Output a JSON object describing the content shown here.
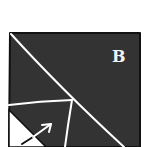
{
  "diagram": {
    "kind": "folding-illustration",
    "colors": {
      "background": "#ffffff",
      "paper": "#333333",
      "border": "#111111",
      "crease": "#ffffff",
      "flap": "#ffffff",
      "arrow_on_dark": "#ffffff",
      "arrow_on_light": "#111111",
      "label": "#f4f4f4"
    },
    "label": {
      "text": "B",
      "x": 116,
      "y": 62
    },
    "paper_square": {
      "top_left": [
        10,
        33
      ],
      "top_right": [
        140,
        33
      ],
      "bottom_left": [
        9,
        147
      ],
      "bottom_right": [
        140,
        147
      ]
    },
    "creases": [
      {
        "name": "main-diagonal",
        "from": [
          11,
          34
        ],
        "to": [
          124,
          147
        ]
      },
      {
        "name": "horizontal-fold",
        "from": [
          9,
          105
        ],
        "to": [
          72,
          100
        ]
      },
      {
        "name": "vertical-fold",
        "from": [
          72,
          100
        ],
        "to": [
          65,
          147
        ]
      }
    ],
    "flap_triangle": [
      [
        9,
        110
      ],
      [
        9,
        147
      ],
      [
        46,
        147
      ]
    ],
    "arrow": {
      "from": [
        22,
        144
      ],
      "to": [
        51,
        124
      ],
      "direction": "up-right"
    }
  }
}
